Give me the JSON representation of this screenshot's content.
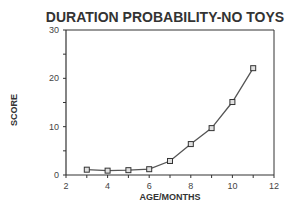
{
  "chart_data": {
    "type": "line",
    "title": "DURATION PROBABILITY-NO TOYS",
    "xlabel": "AGE/MONTHS",
    "ylabel": "SCORE",
    "xlim": [
      2,
      12
    ],
    "ylim": [
      0,
      30
    ],
    "xticks": [
      2,
      4,
      6,
      8,
      10,
      12
    ],
    "yticks": [
      0,
      10,
      20,
      30
    ],
    "grid": false,
    "legend": null,
    "series": [
      {
        "name": "Duration probability",
        "marker": "square",
        "x": [
          3,
          4,
          5,
          6,
          7,
          8,
          9,
          10,
          11
        ],
        "y": [
          1.1,
          0.9,
          1.0,
          1.2,
          2.9,
          6.4,
          9.7,
          15.1,
          22.1
        ]
      }
    ]
  },
  "colors": {
    "line": "#555555",
    "axis": "#333333",
    "marker_fill": "#e0e0e0"
  }
}
